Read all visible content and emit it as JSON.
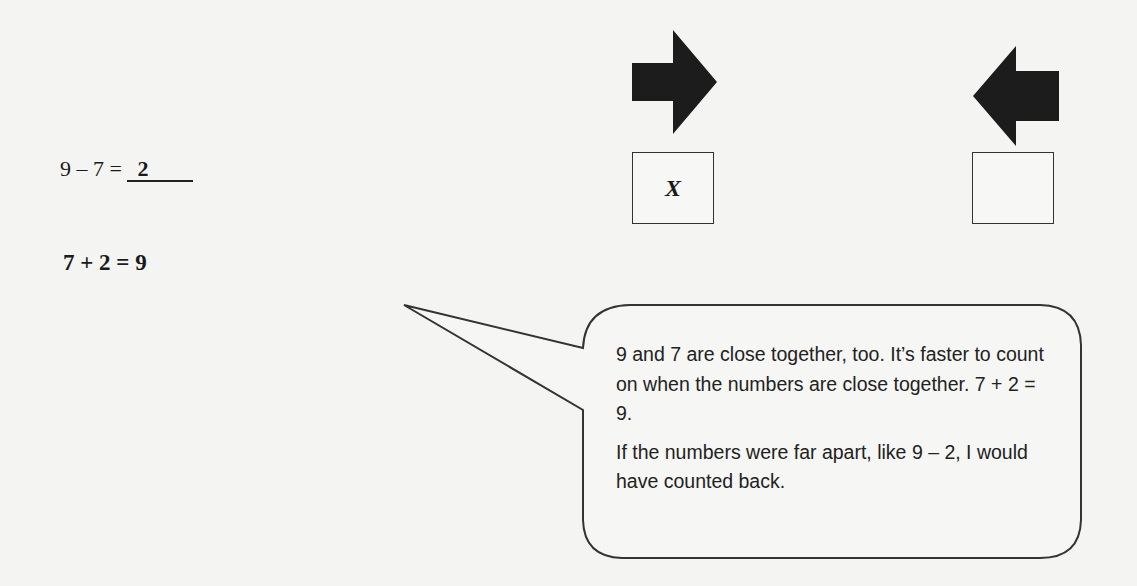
{
  "problem": {
    "equation": "9 – 7 = ",
    "answer": "2",
    "check_equation": "7 + 2 = 9"
  },
  "strategy_boxes": [
    {
      "direction": "count-on",
      "icon": "arrow-right-icon",
      "mark": "X"
    },
    {
      "direction": "count-back",
      "icon": "arrow-left-icon",
      "mark": ""
    }
  ],
  "callout": {
    "paragraph1": "9 and 7 are close together, too.  It’s faster to count on when the numbers are close together.  7 + 2 = 9.",
    "paragraph2": "If the numbers were far apart, like 9 – 2, I would have counted back."
  },
  "colors": {
    "arrow": "#1c1c1c",
    "stroke": "#333333",
    "background": "#f4f4f2"
  }
}
